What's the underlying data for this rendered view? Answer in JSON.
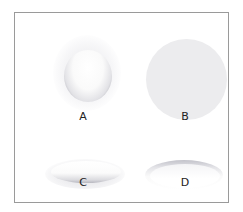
{
  "figure": {
    "panels": [
      {
        "label": "A",
        "description": "raised sphere with shadow at bottom"
      },
      {
        "label": "B",
        "description": "flat grey disc"
      },
      {
        "label": "C",
        "description": "raised pillow ellipse"
      },
      {
        "label": "D",
        "description": "recessed ellipse"
      }
    ]
  },
  "colors": {
    "frame": "#9a9a9a",
    "disc": "#ececee",
    "shadow": "#a8a8b0"
  }
}
